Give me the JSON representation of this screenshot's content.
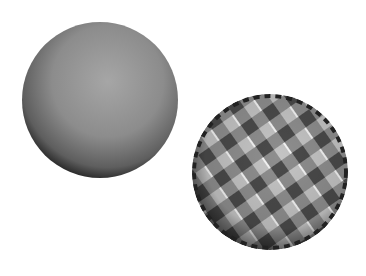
{
  "scene": {
    "description": "Two rendered spheres: a plain gray shaded sphere and a checkerboard-textured sphere",
    "background": "#ffffff",
    "spheres": [
      {
        "name": "plain-sphere",
        "cx": 100,
        "cy": 100,
        "r": 78,
        "base_color": "#8a8a8a",
        "highlight": "#a8a8a8",
        "shadow": "#2a2a2a"
      },
      {
        "name": "checkered-sphere",
        "cx": 270,
        "cy": 172,
        "r": 78,
        "base_color": "#8c8c8c",
        "check_light": "#c8c8c8",
        "check_dark": "#3a3a3a"
      }
    ]
  }
}
